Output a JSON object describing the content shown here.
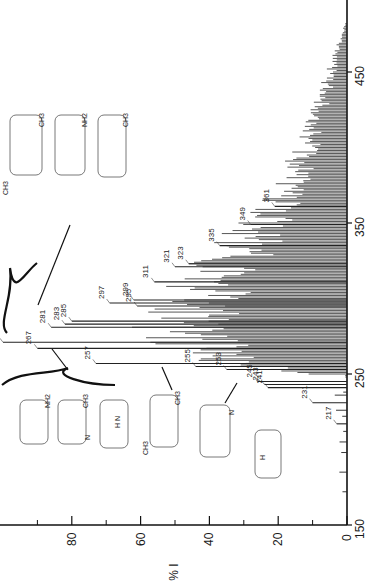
{
  "chart_data": {
    "type": "bar",
    "orientation": "rotated-90-ccw",
    "title": "",
    "xlabel": "m/z",
    "ylabel": "% I",
    "xlim": [
      150,
      480
    ],
    "ylim": [
      0,
      100
    ],
    "x_ticks": [
      150,
      250,
      350,
      450
    ],
    "y_ticks": [
      0,
      20,
      40,
      60,
      80
    ],
    "y_minor_ticks": [
      10,
      30,
      50,
      70,
      90
    ],
    "grid": false,
    "legend": null,
    "labeled_peaks": [
      {
        "mz": 217,
        "intensity": 3
      },
      {
        "mz": 231,
        "intensity": 10
      },
      {
        "mz": 241,
        "intensity": 23
      },
      {
        "mz": 243,
        "intensity": 24
      },
      {
        "mz": 245,
        "intensity": 26
      },
      {
        "mz": 253,
        "intensity": 35
      },
      {
        "mz": 255,
        "intensity": 44
      },
      {
        "mz": 257,
        "intensity": 73
      },
      {
        "mz": 267,
        "intensity": 90
      },
      {
        "mz": 271,
        "intensity": 100
      },
      {
        "mz": 281,
        "intensity": 86
      },
      {
        "mz": 283,
        "intensity": 82
      },
      {
        "mz": 285,
        "intensity": 80
      },
      {
        "mz": 295,
        "intensity": 61
      },
      {
        "mz": 297,
        "intensity": 69
      },
      {
        "mz": 299,
        "intensity": 62
      },
      {
        "mz": 311,
        "intensity": 56
      },
      {
        "mz": 321,
        "intensity": 50
      },
      {
        "mz": 323,
        "intensity": 46
      },
      {
        "mz": 335,
        "intensity": 37
      },
      {
        "mz": 349,
        "intensity": 28
      },
      {
        "mz": 361,
        "intensity": 21
      }
    ],
    "envelope": {
      "description": "dense unresolved peak envelope decaying from ~50% near m/z 300 to ~0% near m/z 480",
      "points": [
        [
          250,
          18
        ],
        [
          260,
          45
        ],
        [
          280,
          55
        ],
        [
          300,
          50
        ],
        [
          320,
          42
        ],
        [
          340,
          33
        ],
        [
          360,
          25
        ],
        [
          380,
          19
        ],
        [
          400,
          14
        ],
        [
          420,
          10
        ],
        [
          440,
          7
        ],
        [
          460,
          4
        ],
        [
          480,
          1
        ]
      ]
    },
    "annotations": [
      {
        "target_mz": 267,
        "structures": [
          "aminopyrene (NH2)",
          "methyl-azabenzopyrene (CH3, N)",
          "dibenzocarbazole (H N)"
        ],
        "grouping": "brace"
      },
      {
        "target_mz": 257,
        "structures": [
          "dimethyl-azachrysene (CH3, CH3, N)"
        ],
        "grouping": "arrow"
      },
      {
        "target_mz": 253,
        "structures": [
          "azabenzo[a]pyrene (N)"
        ],
        "grouping": "arrow"
      },
      {
        "target_mz": 267,
        "structures": [
          "benzocarbazole (H N)"
        ],
        "grouping": "none"
      },
      {
        "target_mz": 281,
        "structures": [
          "methyl-aza-PAH (CH3, N, CH3)",
          "amino-methyl-PAH (NH2, CH3)",
          "methyl-dibenzocarbazole (H N, CH3)"
        ],
        "grouping": "brace"
      }
    ]
  },
  "axis": {
    "mz_ticks": [
      "150",
      "250",
      "350",
      "450"
    ],
    "intensity_ticks": [
      "0",
      "20",
      "40",
      "60",
      "80"
    ],
    "intensity_label": "% I"
  },
  "structures": {
    "group1": [
      "NH2",
      "CH3",
      "N",
      "H N"
    ],
    "single1": [
      "CH3",
      "CH3",
      "N"
    ],
    "single2": [
      "N"
    ],
    "single3": [
      "H",
      "N"
    ],
    "group2": [
      "CH3",
      "N",
      "CH3",
      "NH2",
      "CH3",
      "H",
      "N",
      "CH3"
    ],
    "plus": "+"
  }
}
